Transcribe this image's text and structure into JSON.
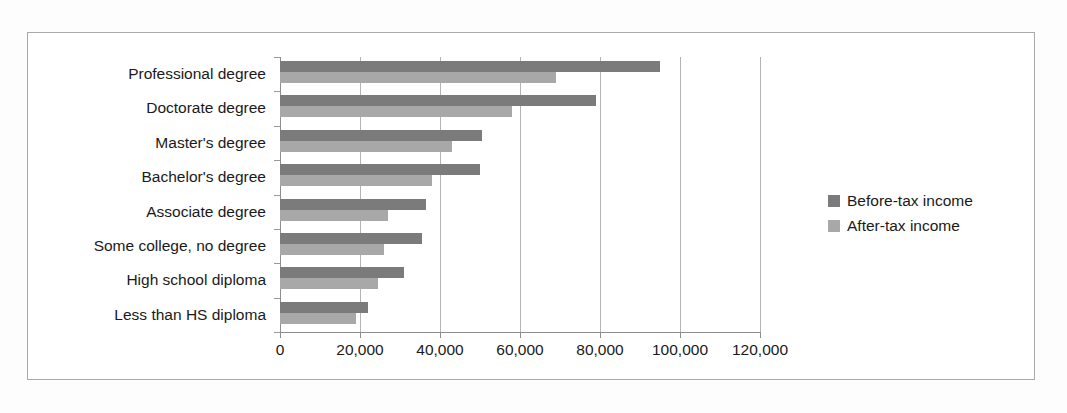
{
  "chart_data": {
    "type": "bar",
    "orientation": "horizontal",
    "title": "",
    "subtitle": "",
    "xlabel": "",
    "ylabel": "",
    "xlim": [
      0,
      120000
    ],
    "xticks": [
      0,
      20000,
      40000,
      60000,
      80000,
      100000,
      120000
    ],
    "xticklabels": [
      "0",
      "20,000",
      "40,000",
      "60,000",
      "80,000",
      "100,000",
      "120,000"
    ],
    "grid": true,
    "grid_axis": "x",
    "legend_position": "right",
    "categories": [
      "Professional degree",
      "Doctorate degree",
      "Master's degree",
      "Bachelor's degree",
      "Associate degree",
      "Some college, no degree",
      "High school diploma",
      "Less than HS diploma"
    ],
    "series": [
      {
        "name": "Before-tax income",
        "color": "#7b7b7b",
        "values": [
          95000,
          79000,
          50500,
          50000,
          36500,
          35500,
          31000,
          22000
        ]
      },
      {
        "name": "After-tax income",
        "color": "#a8a8a8",
        "values": [
          69000,
          58000,
          43000,
          38000,
          27000,
          26000,
          24500,
          19000
        ]
      }
    ]
  },
  "legend": {
    "items": [
      {
        "label": "Before-tax income",
        "color": "#7b7b7b"
      },
      {
        "label": "After-tax income",
        "color": "#a8a8a8"
      }
    ]
  },
  "colors": {
    "before_tax": "#7b7b7b",
    "after_tax": "#a8a8a8",
    "gridline": "#b4b4b4",
    "axis": "#8e8e8e",
    "frame": "#a9a9a9",
    "text": "#1a1a1a",
    "background": "#ffffff"
  }
}
